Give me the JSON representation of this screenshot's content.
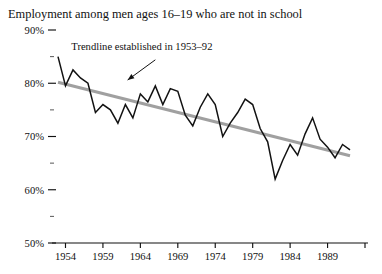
{
  "chart_data": {
    "type": "line",
    "title": "Employment among men ages 16–19 who are not in school",
    "xlabel": "",
    "ylabel": "",
    "xlim": [
      1953,
      1994
    ],
    "ylim": [
      50,
      90
    ],
    "grid": false,
    "legend": false,
    "y_tick_labels": [
      "90%",
      "80%",
      "70%",
      "60%",
      "50%"
    ],
    "y_ticks": [
      90,
      80,
      70,
      60,
      50
    ],
    "y_minor_ticks": [
      85,
      75,
      65,
      55
    ],
    "x_tick_labels": [
      "1954",
      "1959",
      "1964",
      "1969",
      "1974",
      "1979",
      "1984",
      "1989"
    ],
    "x_ticks": [
      1954,
      1959,
      1964,
      1969,
      1974,
      1979,
      1984,
      1989
    ],
    "x_extra_ticks": [
      1994
    ],
    "series": [
      {
        "name": "Employment rate",
        "color": "#121212",
        "x": [
          1953,
          1954,
          1955,
          1956,
          1957,
          1958,
          1959,
          1960,
          1961,
          1962,
          1963,
          1964,
          1965,
          1966,
          1967,
          1968,
          1969,
          1970,
          1971,
          1972,
          1973,
          1974,
          1975,
          1976,
          1977,
          1978,
          1979,
          1980,
          1981,
          1982,
          1983,
          1984,
          1985,
          1986,
          1987,
          1988,
          1989,
          1990,
          1991,
          1992
        ],
        "values": [
          85.0,
          79.5,
          82.5,
          81.0,
          80.0,
          74.5,
          76.0,
          75.0,
          72.5,
          76.0,
          73.5,
          78.0,
          76.5,
          79.5,
          76.0,
          79.0,
          78.5,
          74.0,
          72.0,
          75.5,
          78.0,
          76.0,
          70.0,
          72.5,
          74.5,
          77.0,
          76.0,
          71.5,
          69.0,
          62.0,
          65.5,
          68.5,
          66.5,
          70.5,
          73.5,
          69.5,
          68.0,
          66.0,
          68.5,
          67.5
        ]
      },
      {
        "name": "Trendline established in 1953–92",
        "color": "#a0a0a0",
        "x": [
          1953,
          1992
        ],
        "values": [
          80.2,
          66.4
        ]
      }
    ],
    "annotations": [
      {
        "text": "Trendline established in 1953–92",
        "text_x": 1964.2,
        "text_y": 86.3,
        "arrow_from_x": 1966.0,
        "arrow_from_y": 84.4,
        "arrow_to_x": 1962.3,
        "arrow_to_y": 80.6
      }
    ]
  }
}
